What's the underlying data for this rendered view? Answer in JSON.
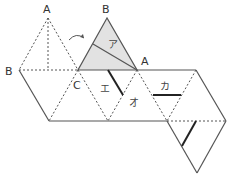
{
  "diagram": {
    "type": "net of triangular faces (octahedron-like net)",
    "labels": {
      "A_left": "A",
      "B_left": "B",
      "C": "C",
      "B_top": "B",
      "A_right": "A",
      "a": "ア",
      "e": "エ",
      "o": "オ",
      "ka": "カ"
    },
    "colors": {
      "line": "#555555",
      "shade": "#e2e2e2",
      "thick": "#222222"
    }
  }
}
